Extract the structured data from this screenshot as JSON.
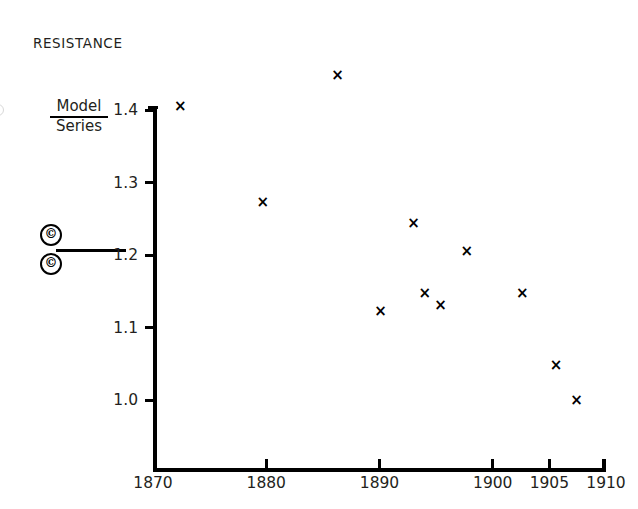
{
  "chart_data": {
    "type": "scatter",
    "title": "RESISTANCE",
    "xlabel": "",
    "ylabel": "",
    "xlim": [
      1870,
      1910
    ],
    "ylim": [
      1.0,
      1.4
    ],
    "grid": false,
    "legend_position": "left",
    "marker": "x",
    "xticks": [
      1870,
      1880,
      1890,
      1900,
      1905,
      1910
    ],
    "xticklabels": [
      "1870",
      "1880",
      "1890",
      "1900",
      "1905",
      "1910"
    ],
    "yticks": [
      1.0,
      1.1,
      1.2,
      1.3,
      1.4
    ],
    "yticklabels": [
      "1.0",
      "1.1",
      "1.2",
      "1.3",
      "1.4"
    ],
    "series": [
      {
        "name": "Model / Series",
        "x": [
          1872.4,
          1879.7,
          1886.3,
          1890.1,
          1893.0,
          1894.0,
          1895.4,
          1897.7,
          1902.6,
          1905.6,
          1907.4
        ],
        "y": [
          1.405,
          1.273,
          1.448,
          1.122,
          1.243,
          1.147,
          1.13,
          1.205,
          1.147,
          1.047,
          1.0
        ]
      }
    ],
    "annotations": []
  },
  "legend": {
    "ratio_numerator": "Model",
    "ratio_denominator": "Series",
    "symbol_top": "©",
    "symbol_bottom": "©"
  }
}
